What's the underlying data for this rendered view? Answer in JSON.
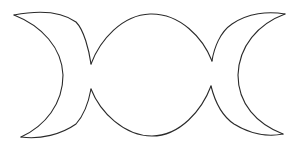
{
  "figure": {
    "background_color": "#ffffff",
    "stroke_color": "#2a2a2a",
    "stroke_width": 1.1,
    "parts": [
      {
        "name": "waxing-crescent-left"
      },
      {
        "name": "full-moon-center"
      },
      {
        "name": "waning-crescent-right"
      }
    ]
  }
}
